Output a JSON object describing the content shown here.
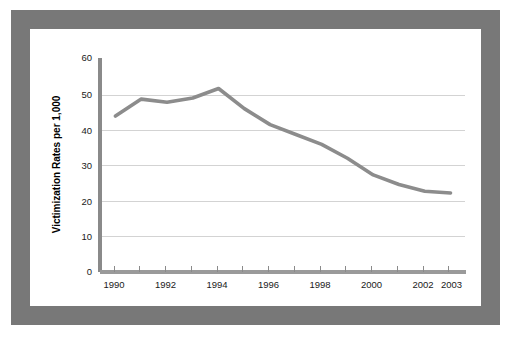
{
  "figure": {
    "border_color": "#787878",
    "background_color": "#ffffff",
    "plot_background_color": "#ffffff"
  },
  "chart_data": {
    "type": "line",
    "title": "",
    "subtitle": "",
    "xlabel": "",
    "ylabel": "Victimization Rates per 1,000",
    "x": [
      1990,
      1991,
      1992,
      1993,
      1994,
      1995,
      1996,
      1997,
      1998,
      1999,
      2000,
      2001,
      2002,
      2003
    ],
    "values": [
      44.0,
      48.8,
      47.9,
      49.1,
      51.8,
      46.1,
      41.6,
      38.8,
      36.0,
      32.1,
      27.4,
      24.7,
      22.8,
      22.3
    ],
    "series": [
      {
        "name": "Victimization Rate",
        "color": "#8c8c8c",
        "values": [
          44.0,
          48.8,
          47.9,
          49.1,
          51.8,
          46.1,
          41.6,
          38.8,
          36.0,
          32.1,
          27.4,
          24.7,
          22.8,
          22.3
        ]
      }
    ],
    "xlim": [
      1989.4,
      2003.6
    ],
    "ylim": [
      0,
      60
    ],
    "xticks": [
      1990,
      1991,
      1992,
      1993,
      1994,
      1995,
      1996,
      1997,
      1998,
      1999,
      2000,
      2001,
      2002,
      2003
    ],
    "xtick_labels": [
      "1990",
      "",
      "1992",
      "",
      "1994",
      "",
      "1996",
      "",
      "1998",
      "",
      "2000",
      "",
      "2002",
      "2003"
    ],
    "yticks": [
      0,
      10,
      20,
      30,
      40,
      50,
      60
    ],
    "ytick_labels": [
      "0",
      "10",
      "20",
      "30",
      "40",
      "50",
      "60"
    ],
    "grid": "horizontal",
    "grid_color": "#d3d3d3",
    "legend": "none",
    "legend_position": "none",
    "line_color": "#8c8c8c",
    "annotations": []
  }
}
